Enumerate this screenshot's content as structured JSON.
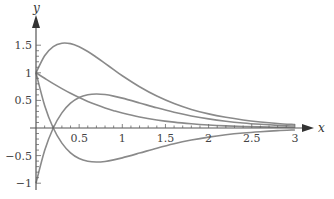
{
  "chart_data": {
    "type": "line",
    "title": "",
    "xlabel": "x",
    "ylabel": "y",
    "xlim": [
      0,
      3
    ],
    "ylim": [
      -1,
      1.5
    ],
    "grid": false,
    "legend": null,
    "x_ticks": [
      0.5,
      1,
      1.5,
      2,
      2.5,
      3
    ],
    "x_tick_labels": [
      "0.5",
      "1",
      "1.5",
      "2",
      "2.5",
      "3"
    ],
    "y_ticks": [
      1.5,
      1,
      0.5,
      -0.5,
      -1
    ],
    "y_tick_labels": [
      "1.5",
      "1",
      "0.5",
      "−0.5",
      "−1"
    ],
    "x": [
      0,
      0.1,
      0.2,
      0.3,
      0.4,
      0.5,
      0.6,
      0.7,
      0.8,
      0.9,
      1.0,
      1.2,
      1.4,
      1.6,
      1.8,
      2.0,
      2.2,
      2.4,
      2.6,
      2.8,
      3.0
    ],
    "series": [
      {
        "name": "curve-peak-1.5",
        "values": [
          1.0,
          1.31,
          1.475,
          1.536,
          1.528,
          1.472,
          1.386,
          1.282,
          1.171,
          1.058,
          0.947,
          0.748,
          0.579,
          0.444,
          0.337,
          0.256,
          0.194,
          0.146,
          0.11,
          0.082,
          0.062
        ]
      },
      {
        "name": "curve-decay",
        "values": [
          1.0,
          0.901,
          0.804,
          0.714,
          0.629,
          0.552,
          0.482,
          0.42,
          0.363,
          0.314,
          0.271,
          0.2,
          0.146,
          0.106,
          0.077,
          0.055,
          0.039,
          0.028,
          0.02,
          0.014,
          0.01
        ]
      },
      {
        "name": "curve-from-minus-1",
        "values": [
          -1.0,
          -0.409,
          0.0,
          0.274,
          0.449,
          0.552,
          0.602,
          0.617,
          0.606,
          0.578,
          0.541,
          0.454,
          0.365,
          0.285,
          0.219,
          0.165,
          0.123,
          0.091,
          0.067,
          0.048,
          0.035
        ]
      },
      {
        "name": "curve-from-1-down",
        "values": [
          1.0,
          0.409,
          0.0,
          -0.274,
          -0.449,
          -0.552,
          -0.602,
          -0.617,
          -0.606,
          -0.578,
          -0.541,
          -0.454,
          -0.365,
          -0.285,
          -0.219,
          -0.165,
          -0.123,
          -0.091,
          -0.067,
          -0.048,
          -0.035
        ]
      }
    ],
    "colors": {
      "curves": "#8a8a8a",
      "axis": "#555555",
      "text": "#444444"
    }
  }
}
